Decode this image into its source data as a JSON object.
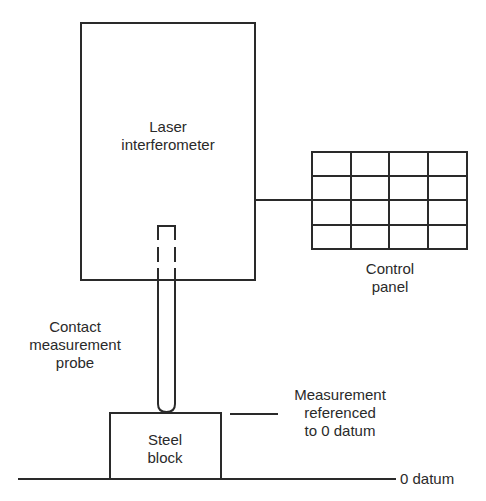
{
  "diagram": {
    "laser": {
      "line1": "Laser",
      "line2": "interferometer"
    },
    "control_panel": {
      "line1": "Control",
      "line2": "panel",
      "rows": 4,
      "cols": 4
    },
    "probe": {
      "line1": "Contact",
      "line2": "measurement",
      "line3": "probe"
    },
    "block": {
      "line1": "Steel",
      "line2": "block"
    },
    "reference": {
      "line1": "Measurement",
      "line2": "referenced",
      "line3": "to 0 datum"
    },
    "datum": {
      "label": "0 datum"
    },
    "colors": {
      "stroke": "#2a2a2a",
      "background": "#ffffff"
    }
  }
}
